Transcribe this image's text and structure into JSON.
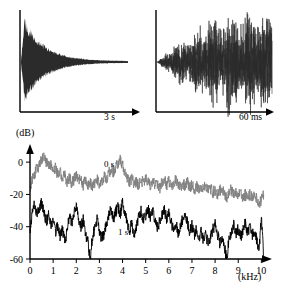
{
  "figure": {
    "panels": {
      "waveform_decay": {
        "name": "decaying envelope waveform",
        "time_axis_label": "3 s",
        "duration_value": 3,
        "duration_unit": "s",
        "waveform_color": "#2b2b2b"
      },
      "waveform_detail": {
        "name": "expanded time detail waveform",
        "time_axis_label": "60 ms",
        "duration_value": 60,
        "duration_unit": "ms",
        "waveform_color": "#2b2b2b"
      }
    }
  },
  "chart_data": {
    "type": "line",
    "title": "",
    "subtitle": "",
    "xlabel": "(kHz)",
    "ylabel": "(dB)",
    "xlim": [
      0,
      10.2
    ],
    "ylim": [
      -60,
      10
    ],
    "grid": false,
    "legend_position": "inline-annotation",
    "x_tick_labels": [
      "0",
      "1",
      "2",
      "3",
      "4",
      "5",
      "6",
      "7",
      "8",
      "9",
      "10"
    ],
    "x_ticks": [
      0,
      1,
      2,
      3,
      4,
      5,
      6,
      7,
      8,
      9,
      10
    ],
    "y_tick_labels": [
      "0",
      "-20",
      "-40",
      "-60"
    ],
    "y_ticks": [
      0,
      -20,
      -40,
      -60
    ],
    "series": [
      {
        "name": "0 s",
        "label": "0 s",
        "color": "#808080",
        "annotation_x": 3.2,
        "annotation_y": -3,
        "x": [
          0.0,
          0.1,
          0.2,
          0.3,
          0.4,
          0.5,
          0.6,
          0.7,
          0.8,
          0.9,
          1.0,
          1.1,
          1.2,
          1.3,
          1.4,
          1.5,
          1.6,
          1.7,
          1.8,
          1.9,
          2.0,
          2.1,
          2.2,
          2.3,
          2.4,
          2.5,
          2.6,
          2.7,
          2.8,
          2.9,
          3.0,
          3.1,
          3.2,
          3.3,
          3.4,
          3.5,
          3.6,
          3.7,
          3.8,
          3.9,
          4.0,
          4.1,
          4.2,
          4.3,
          4.4,
          4.5,
          4.6,
          4.7,
          4.8,
          4.9,
          5.0,
          5.1,
          5.2,
          5.3,
          5.4,
          5.5,
          5.6,
          5.7,
          5.8,
          5.9,
          6.0,
          6.1,
          6.2,
          6.3,
          6.4,
          6.5,
          6.6,
          6.7,
          6.8,
          6.9,
          7.0,
          7.1,
          7.2,
          7.3,
          7.4,
          7.5,
          7.6,
          7.7,
          7.8,
          7.9,
          8.0,
          8.1,
          8.2,
          8.3,
          8.4,
          8.5,
          8.6,
          8.7,
          8.8,
          8.9,
          9.0,
          9.1,
          9.2,
          9.3,
          9.4,
          9.5,
          9.6,
          9.7,
          9.8,
          9.9,
          10.0,
          10.1
        ],
        "y": [
          -17,
          -11,
          -7,
          -4,
          -2,
          1,
          3,
          0,
          -3,
          -2,
          -5,
          -3,
          -8,
          -6,
          -10,
          -8,
          -12,
          -9,
          -13,
          -11,
          -8,
          -12,
          -10,
          -14,
          -11,
          -15,
          -12,
          -16,
          -13,
          -11,
          -14,
          -12,
          -9,
          -11,
          -7,
          -4,
          -6,
          -3,
          -1,
          2,
          -2,
          -6,
          -9,
          -12,
          -10,
          -14,
          -12,
          -15,
          -11,
          -13,
          -10,
          -12,
          -14,
          -11,
          -15,
          -13,
          -16,
          -13,
          -11,
          -14,
          -12,
          -15,
          -13,
          -11,
          -14,
          -16,
          -13,
          -15,
          -12,
          -16,
          -14,
          -17,
          -15,
          -18,
          -15,
          -17,
          -14,
          -18,
          -16,
          -19,
          -17,
          -20,
          -18,
          -16,
          -19,
          -22,
          -19,
          -17,
          -20,
          -18,
          -21,
          -19,
          -22,
          -20,
          -23,
          -20,
          -22,
          -19,
          -23,
          -26,
          -23,
          -20
        ]
      },
      {
        "name": "1 s",
        "label": "1 s",
        "color": "#000000",
        "annotation_x": 3.8,
        "annotation_y": -45,
        "x": [
          0.0,
          0.1,
          0.2,
          0.3,
          0.4,
          0.5,
          0.6,
          0.7,
          0.8,
          0.9,
          1.0,
          1.1,
          1.2,
          1.3,
          1.4,
          1.5,
          1.6,
          1.7,
          1.8,
          1.9,
          2.0,
          2.1,
          2.2,
          2.3,
          2.4,
          2.5,
          2.6,
          2.7,
          2.8,
          2.9,
          3.0,
          3.1,
          3.2,
          3.3,
          3.4,
          3.5,
          3.6,
          3.7,
          3.8,
          3.9,
          4.0,
          4.1,
          4.2,
          4.3,
          4.4,
          4.5,
          4.6,
          4.7,
          4.8,
          4.9,
          5.0,
          5.1,
          5.2,
          5.3,
          5.4,
          5.5,
          5.6,
          5.7,
          5.8,
          5.9,
          6.0,
          6.1,
          6.2,
          6.3,
          6.4,
          6.5,
          6.6,
          6.7,
          6.8,
          6.9,
          7.0,
          7.1,
          7.2,
          7.3,
          7.4,
          7.5,
          7.6,
          7.7,
          7.8,
          7.9,
          8.0,
          8.1,
          8.2,
          8.3,
          8.4,
          8.5,
          8.6,
          8.7,
          8.8,
          8.9,
          9.0,
          9.1,
          9.2,
          9.3,
          9.4,
          9.5,
          9.6,
          9.7,
          9.8,
          9.9,
          10.0,
          10.1
        ],
        "y": [
          -44,
          -31,
          -26,
          -33,
          -29,
          -25,
          -32,
          -37,
          -33,
          -40,
          -36,
          -43,
          -39,
          -46,
          -42,
          -48,
          -44,
          -33,
          -38,
          -32,
          -28,
          -35,
          -40,
          -36,
          -44,
          -49,
          -60,
          -46,
          -41,
          -36,
          -42,
          -48,
          -44,
          -39,
          -34,
          -29,
          -35,
          -31,
          -27,
          -33,
          -24,
          -31,
          -37,
          -42,
          -38,
          -44,
          -40,
          -34,
          -30,
          -36,
          -33,
          -29,
          -34,
          -30,
          -36,
          -41,
          -37,
          -33,
          -29,
          -35,
          -31,
          -37,
          -42,
          -38,
          -44,
          -40,
          -35,
          -31,
          -37,
          -43,
          -39,
          -45,
          -41,
          -47,
          -43,
          -49,
          -45,
          -51,
          -47,
          -42,
          -38,
          -44,
          -50,
          -46,
          -52,
          -60,
          -48,
          -43,
          -39,
          -45,
          -41,
          -47,
          -43,
          -38,
          -44,
          -40,
          -46,
          -42,
          -48,
          -54,
          -35,
          -59
        ]
      }
    ]
  }
}
